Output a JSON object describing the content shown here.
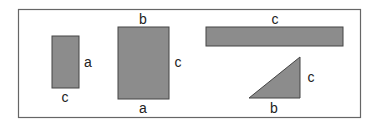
{
  "diagram": {
    "colors": {
      "fill": "#8c8c8c",
      "stroke": "#444444",
      "frame": "#666666"
    },
    "frame": {
      "x": 18,
      "y": 9,
      "w": 342,
      "h": 108
    },
    "shapes": [
      {
        "id": "small-rect",
        "type": "rect",
        "x": 52,
        "y": 36,
        "w": 27,
        "h": 52,
        "labels": [
          {
            "text": "a",
            "x": 88,
            "y": 67
          },
          {
            "text": "c",
            "x": 65,
            "y": 102
          }
        ]
      },
      {
        "id": "big-rect",
        "type": "rect",
        "x": 118,
        "y": 27,
        "w": 51,
        "h": 72,
        "labels": [
          {
            "text": "b",
            "x": 143,
            "y": 24
          },
          {
            "text": "c",
            "x": 178,
            "y": 67
          },
          {
            "text": "a",
            "x": 143,
            "y": 113
          }
        ]
      },
      {
        "id": "long-bar",
        "type": "rect",
        "x": 206,
        "y": 27,
        "w": 137,
        "h": 19,
        "labels": [
          {
            "text": "c",
            "x": 275,
            "y": 24
          }
        ]
      },
      {
        "id": "triangle",
        "type": "triangle",
        "points": "249,98 300,98 300,57",
        "labels": [
          {
            "text": "c",
            "x": 311,
            "y": 82
          },
          {
            "text": "b",
            "x": 274,
            "y": 113
          }
        ]
      }
    ]
  }
}
